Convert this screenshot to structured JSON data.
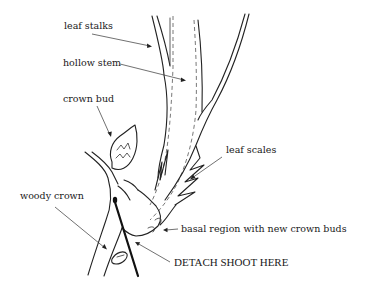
{
  "diagram": {
    "labels": {
      "leaf_stalks": "leaf stalks",
      "hollow_stem": "hollow stem",
      "crown_bud": "crown bud",
      "leaf_scales": "leaf scales",
      "woody_crown": "woody crown",
      "basal_region": "basal region with new crown buds",
      "detach_instruction": "DETACH SHOOT HERE"
    },
    "colors": {
      "ink": "#222222",
      "background": "#ffffff"
    }
  }
}
